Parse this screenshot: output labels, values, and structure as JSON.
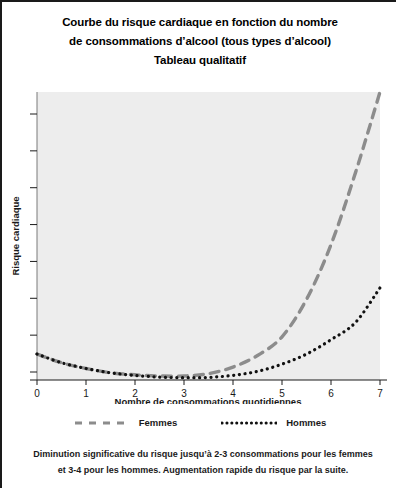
{
  "title": {
    "line1": "Courbe du risque cardiaque en fonction du nombre",
    "line2": "de consommations d’alcool (tous types d’alcool)",
    "line3": "Tableau qualitatif"
  },
  "legend": {
    "femmes_label": "Femmes",
    "hommes_label": "Hommes"
  },
  "caption": {
    "line1": "Diminution significative du risque jusqu’à 2-3 consommations pour les femmes",
    "line2": "et 3-4 pour les hommes. Augmentation rapide du risque par la suite."
  },
  "colors": {
    "femmes": "#8c8c8c",
    "hommes": "#111111",
    "plot_background": "#ededed",
    "axis": "#7a7a7a",
    "text": "#1a1a1a"
  },
  "chart_data": {
    "type": "line",
    "xlabel": "Nombre de consommations quotidiennes",
    "ylabel": "Risque cardiaque",
    "xlim": [
      0,
      7
    ],
    "ylim": [
      0,
      1
    ],
    "xticks": [
      0,
      1,
      2,
      3,
      4,
      5,
      6,
      7
    ],
    "xticklabels": [
      "0",
      "1",
      "2",
      "3",
      "4",
      "5",
      "6",
      "7"
    ],
    "yticks": [],
    "yticklabels": [],
    "grid": false,
    "legend_position": "below-axes",
    "note": "Qualitative J-shaped curves; y axis unlabelled (relative cardiac risk).",
    "x": [
      0,
      0.5,
      1,
      1.5,
      2,
      2.5,
      3,
      3.5,
      4,
      4.5,
      5,
      5.5,
      6,
      6.5,
      7
    ],
    "series": [
      {
        "name": "Femmes",
        "style": "dashed",
        "color": "#8c8c8c",
        "values": [
          0.09,
          0.06,
          0.04,
          0.025,
          0.018,
          0.014,
          0.014,
          0.022,
          0.045,
          0.085,
          0.15,
          0.28,
          0.47,
          0.72,
          1.0
        ]
      },
      {
        "name": "Hommes",
        "style": "dotted",
        "color": "#111111",
        "values": [
          0.09,
          0.06,
          0.04,
          0.025,
          0.016,
          0.01,
          0.008,
          0.009,
          0.016,
          0.03,
          0.055,
          0.09,
          0.14,
          0.2,
          0.32
        ]
      }
    ]
  }
}
